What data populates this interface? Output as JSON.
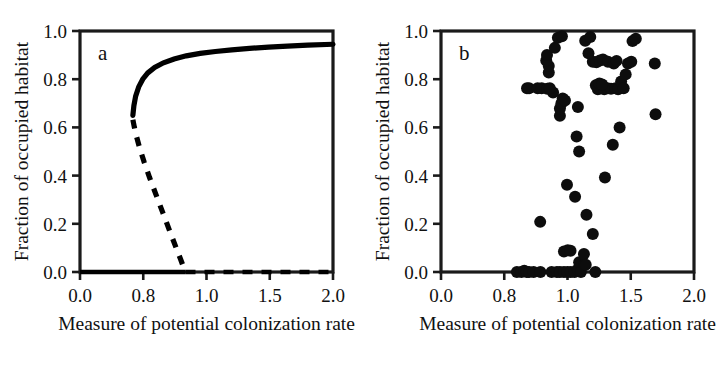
{
  "figure": {
    "background_color": "#ffffff",
    "ink_color": "#000000",
    "panels": [
      {
        "letter": "a",
        "xlabel": "Measure of potential colonization rate",
        "ylabel": "Fraction of occupied habitat"
      },
      {
        "letter": "b",
        "xlabel": "Measure of potential colonization rate",
        "ylabel": "Fraction of occupied habitat"
      }
    ]
  },
  "axes": {
    "x_tick_labels": [
      "0.0",
      "0.8",
      "1.0",
      "1.5",
      "2.0"
    ],
    "y_tick_labels": [
      "1.0",
      "0.8",
      "0.6",
      "0.4",
      "0.2",
      "0.0"
    ],
    "x_tick_positions_fraction": [
      0.0,
      0.25,
      0.5,
      0.75,
      1.0
    ],
    "y_tick_positions_fraction": [
      0.0,
      0.2,
      0.4,
      0.6,
      0.8,
      1.0
    ]
  },
  "chart_data": [
    {
      "type": "line",
      "panel": "a",
      "title": "a",
      "xlabel": "Measure of potential colonization rate",
      "ylabel": "Fraction of occupied habitat",
      "xlim": [
        0.0,
        1.0
      ],
      "ylim": [
        0.0,
        1.0
      ],
      "x_tick_labels": [
        "0.0",
        "0.8",
        "1.0",
        "1.5",
        "2.0"
      ],
      "y_tick_labels": [
        "1.0",
        "0.8",
        "0.6",
        "0.4",
        "0.2",
        "0.0"
      ],
      "grid": false,
      "legend": "none",
      "series": [
        {
          "name": "stable upper equilibrium branch",
          "style": "solid",
          "x": [
            0.209,
            0.213,
            0.22,
            0.232,
            0.248,
            0.268,
            0.295,
            0.33,
            0.372,
            0.42,
            0.475,
            0.535,
            0.6,
            0.67,
            0.745,
            0.82,
            0.9,
            1.0
          ],
          "y": [
            0.65,
            0.69,
            0.73,
            0.768,
            0.8,
            0.826,
            0.849,
            0.868,
            0.884,
            0.897,
            0.907,
            0.915,
            0.922,
            0.928,
            0.933,
            0.937,
            0.941,
            0.945
          ]
        },
        {
          "name": "unstable equilibrium branch",
          "style": "dashed",
          "x": [
            0.209,
            0.215,
            0.224,
            0.237,
            0.254,
            0.275,
            0.3,
            0.328,
            0.356,
            0.38,
            0.398,
            0.41,
            0.417
          ],
          "y": [
            0.632,
            0.6,
            0.56,
            0.51,
            0.455,
            0.392,
            0.322,
            0.244,
            0.166,
            0.1,
            0.052,
            0.018,
            0.0
          ]
        },
        {
          "name": "stable extinction branch",
          "style": "solid",
          "x": [
            0.0,
            0.417
          ],
          "y": [
            0.0,
            0.0
          ]
        },
        {
          "name": "unstable extinction branch",
          "style": "dashed",
          "x": [
            0.417,
            1.0
          ],
          "y": [
            0.0,
            0.0
          ]
        }
      ]
    },
    {
      "type": "scatter",
      "panel": "b",
      "title": "b",
      "xlabel": "Measure of potential colonization rate",
      "ylabel": "Fraction of occupied habitat",
      "xlim": [
        0.0,
        1.0
      ],
      "ylim": [
        0.0,
        1.0
      ],
      "x_tick_labels": [
        "0.0",
        "0.8",
        "1.0",
        "1.5",
        "2.0"
      ],
      "y_tick_labels": [
        "1.0",
        "0.8",
        "0.6",
        "0.4",
        "0.2",
        "0.0"
      ],
      "grid": false,
      "legend": "none",
      "marker": "filled-circle",
      "marker_color": "#0d0d0d",
      "marker_radius_px": 6.0,
      "n_points": 76,
      "points": [
        [
          0.3,
          0.0
        ],
        [
          0.318,
          0.0
        ],
        [
          0.329,
          0.005
        ],
        [
          0.339,
          0.0
        ],
        [
          0.348,
          0.0
        ],
        [
          0.366,
          0.0
        ],
        [
          0.393,
          0.0
        ],
        [
          0.437,
          0.0
        ],
        [
          0.458,
          0.0
        ],
        [
          0.47,
          0.0
        ],
        [
          0.486,
          0.0
        ],
        [
          0.5,
          0.0
        ],
        [
          0.513,
          0.0
        ],
        [
          0.528,
          0.0
        ],
        [
          0.541,
          0.01
        ],
        [
          0.546,
          0.04
        ],
        [
          0.553,
          0.0
        ],
        [
          0.566,
          0.03
        ],
        [
          0.61,
          0.0
        ],
        [
          0.486,
          0.085
        ],
        [
          0.501,
          0.09
        ],
        [
          0.512,
          0.088
        ],
        [
          0.565,
          0.075
        ],
        [
          0.572,
          0.03
        ],
        [
          0.392,
          0.208
        ],
        [
          0.6,
          0.158
        ],
        [
          0.575,
          0.238
        ],
        [
          0.53,
          0.312
        ],
        [
          0.498,
          0.362
        ],
        [
          0.648,
          0.392
        ],
        [
          0.546,
          0.5
        ],
        [
          0.536,
          0.562
        ],
        [
          0.706,
          0.6
        ],
        [
          0.679,
          0.528
        ],
        [
          0.848,
          0.655
        ],
        [
          0.541,
          0.685
        ],
        [
          0.47,
          0.648
        ],
        [
          0.47,
          0.678
        ],
        [
          0.476,
          0.7
        ],
        [
          0.481,
          0.72
        ],
        [
          0.49,
          0.712
        ],
        [
          0.443,
          0.745
        ],
        [
          0.34,
          0.762
        ],
        [
          0.348,
          0.762
        ],
        [
          0.382,
          0.762
        ],
        [
          0.398,
          0.762
        ],
        [
          0.42,
          0.76
        ],
        [
          0.43,
          0.762
        ],
        [
          0.62,
          0.758
        ],
        [
          0.631,
          0.762
        ],
        [
          0.645,
          0.758
        ],
        [
          0.658,
          0.762
        ],
        [
          0.672,
          0.76
        ],
        [
          0.69,
          0.762
        ],
        [
          0.7,
          0.758
        ],
        [
          0.612,
          0.775
        ],
        [
          0.626,
          0.782
        ],
        [
          0.637,
          0.778
        ],
        [
          0.712,
          0.79
        ],
        [
          0.722,
          0.762
        ],
        [
          0.426,
          0.828
        ],
        [
          0.426,
          0.855
        ],
        [
          0.73,
          0.82
        ],
        [
          0.845,
          0.865
        ],
        [
          0.739,
          0.865
        ],
        [
          0.752,
          0.872
        ],
        [
          0.416,
          0.878
        ],
        [
          0.419,
          0.9
        ],
        [
          0.6,
          0.872
        ],
        [
          0.614,
          0.87
        ],
        [
          0.628,
          0.878
        ],
        [
          0.64,
          0.882
        ],
        [
          0.66,
          0.872
        ],
        [
          0.683,
          0.865
        ],
        [
          0.694,
          0.876
        ],
        [
          0.583,
          0.908
        ],
        [
          0.45,
          0.93
        ],
        [
          0.57,
          0.96
        ],
        [
          0.59,
          0.975
        ],
        [
          0.462,
          0.972
        ],
        [
          0.478,
          0.978
        ],
        [
          0.757,
          0.958
        ],
        [
          0.77,
          0.968
        ]
      ]
    }
  ]
}
